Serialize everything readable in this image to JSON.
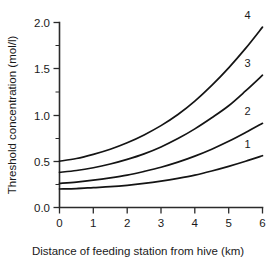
{
  "chart_data": {
    "type": "line",
    "title": "",
    "xlabel": "Distance of feeding station from hive (km)",
    "ylabel": "Threshold concentration (mol/l)",
    "xlim": [
      0,
      6
    ],
    "ylim": [
      0.0,
      2.0
    ],
    "grid": false,
    "legend_position": "curve-end-labels",
    "x_ticks": [
      "0",
      "1",
      "2",
      "3",
      "4",
      "5",
      "6"
    ],
    "x_tick_values": [
      0,
      1,
      2,
      3,
      4,
      5,
      6
    ],
    "y_ticks": [
      "0.0",
      "0.5",
      "1.0",
      "1.5",
      "2.0"
    ],
    "y_tick_values": [
      0.0,
      0.5,
      1.0,
      1.5,
      2.0
    ],
    "y_minor_tick_values": [
      0.25,
      0.75,
      1.25,
      1.75
    ],
    "x": [
      0,
      0.5,
      1,
      1.5,
      2,
      2.5,
      3,
      3.5,
      4,
      4.5,
      5,
      5.5,
      6
    ],
    "series": [
      {
        "name": "1",
        "label": "1",
        "values": [
          0.2,
          0.205,
          0.215,
          0.225,
          0.24,
          0.26,
          0.285,
          0.315,
          0.35,
          0.395,
          0.445,
          0.5,
          0.56
        ]
      },
      {
        "name": "2",
        "label": "2",
        "values": [
          0.26,
          0.275,
          0.295,
          0.32,
          0.35,
          0.39,
          0.435,
          0.49,
          0.555,
          0.63,
          0.715,
          0.81,
          0.91
        ]
      },
      {
        "name": "3",
        "label": "3",
        "values": [
          0.38,
          0.4,
          0.43,
          0.47,
          0.52,
          0.58,
          0.655,
          0.745,
          0.85,
          0.97,
          1.1,
          1.26,
          1.43
        ]
      },
      {
        "name": "4",
        "label": "4",
        "values": [
          0.5,
          0.53,
          0.575,
          0.63,
          0.7,
          0.785,
          0.885,
          1.005,
          1.15,
          1.32,
          1.51,
          1.72,
          1.95
        ]
      }
    ],
    "colors": {
      "curve": "#141414",
      "axis": "#2b2b2b",
      "background": "#ffffff"
    }
  }
}
